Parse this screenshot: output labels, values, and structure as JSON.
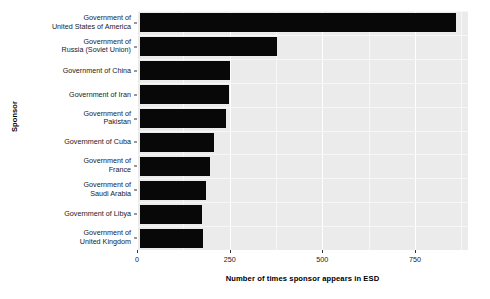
{
  "chart_data": {
    "type": "bar",
    "orientation": "horizontal",
    "title": "",
    "xlabel": "Number of times sponsor appears in ESD",
    "ylabel": "Sponsor",
    "categories": [
      "Government of\nUnited Kingdom",
      "Government of Libya",
      "Government of\nSaudi Arabia",
      "Government of\nFrance",
      "Government of Cuba",
      "Government of\nPakistan",
      "Government of Iran",
      "Government of China",
      "Government of\nRussia (Soviet Union)",
      "Government of\nUnited States of America"
    ],
    "values": [
      178,
      175,
      185,
      198,
      207,
      240,
      248,
      250,
      378,
      860
    ],
    "xlim": [
      0,
      893
    ],
    "xticks": [
      0,
      250,
      500,
      750
    ],
    "xticklabels": [
      "0",
      "250",
      "500",
      "750"
    ],
    "grid": true,
    "legend": false,
    "bar_color": "#080808",
    "panel_color": "#ebebeb",
    "grid_color": "#ffffff"
  },
  "axes": {
    "y_title": "Sponsor",
    "x_title": "Number of times sponsor appears in ESD"
  }
}
